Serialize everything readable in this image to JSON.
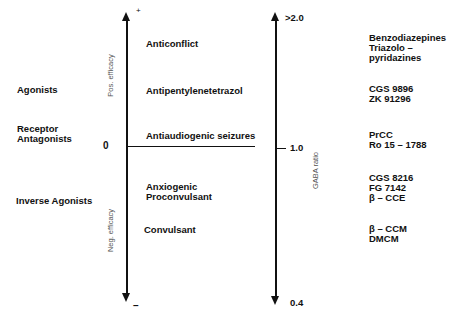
{
  "left_axis": {
    "plus_sign": "+",
    "minus_sign": "–",
    "zero_label": "0",
    "pos_label": "Pos. efficacy",
    "neg_label": "Neg. efficacy"
  },
  "right_axis": {
    "top_label": ">2.0",
    "mid_label": "1.0",
    "bottom_label": "0.4",
    "axis_title": "GABA ratio"
  },
  "ligand_classes": [
    {
      "label": "Agonists"
    },
    {
      "lines": [
        "Receptor",
        "Antagonists"
      ]
    },
    {
      "label": "Inverse Agonists"
    }
  ],
  "effects": [
    {
      "lines": [
        "Anticonflict"
      ]
    },
    {
      "lines": [
        "Antipentylenetetrazol"
      ]
    },
    {
      "lines": [
        "Antiaudiogenic seizures"
      ]
    },
    {
      "lines": [
        "Anxiogenic",
        "Proconvulsant"
      ]
    },
    {
      "lines": [
        "Convulsant"
      ]
    }
  ],
  "compounds": [
    {
      "lines": [
        "Benzodiazepines",
        "Triazolo –",
        "pyridazines"
      ]
    },
    {
      "lines": [
        "CGS 9896",
        "ZK 91296"
      ]
    },
    {
      "lines": [
        "PrCC",
        "Ro 15 – 1788"
      ]
    },
    {
      "lines": [
        "CGS 8216",
        "FG 7142",
        "β – CCE"
      ]
    },
    {
      "lines": [
        "β – CCM",
        "DMCM"
      ]
    }
  ]
}
